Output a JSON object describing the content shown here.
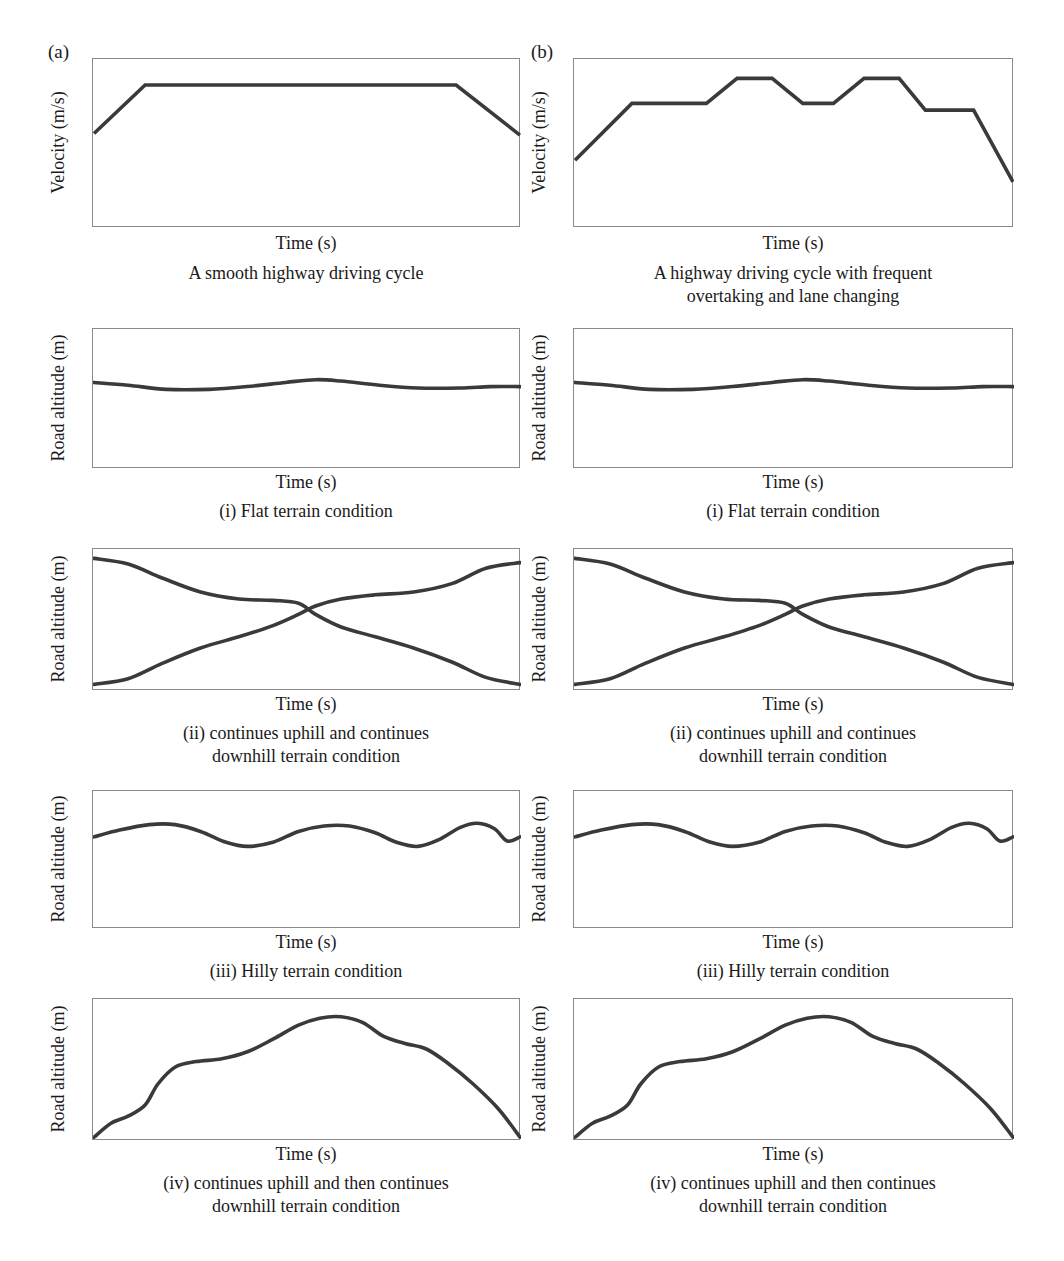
{
  "figure": {
    "columns": [
      {
        "letter": "(a)",
        "caption": "A smooth highway driving cycle"
      },
      {
        "letter": "(b)",
        "caption": "A highway driving cycle with frequent\novertaking and lane changing"
      }
    ],
    "axis_labels": {
      "velocity_y": "Velocity (m/s)",
      "altitude_y": "Road altitude (m)",
      "time_x": "Time (s)"
    },
    "terrain_captions": [
      "(i) Flat terrain condition",
      "(ii) continues uphill and continues\ndownhill terrain condition",
      "(iii) Hilly terrain condition",
      "(iv) continues uphill and then continues\ndownhill terrain condition"
    ],
    "colors": {
      "curve": "#3a3a3a",
      "axis": "#8a8a8a",
      "text": "#1a1a1a",
      "background": "#ffffff"
    }
  },
  "chart_data": [
    {
      "id": "a-velocity",
      "type": "line",
      "title": "A smooth highway driving cycle",
      "xlabel": "Time (s)",
      "ylabel": "Velocity (m/s)",
      "xlim": [
        0,
        100
      ],
      "ylim": [
        0,
        100
      ],
      "grid": false,
      "legend": "none",
      "points": [
        [
          0,
          56
        ],
        [
          12,
          85
        ],
        [
          85,
          85
        ],
        [
          100,
          55
        ]
      ]
    },
    {
      "id": "b-velocity",
      "type": "line",
      "title": "A highway driving cycle with frequent overtaking and lane changing",
      "xlabel": "Time (s)",
      "ylabel": "Velocity (m/s)",
      "xlim": [
        0,
        100
      ],
      "ylim": [
        0,
        100
      ],
      "grid": false,
      "legend": "none",
      "points": [
        [
          0,
          40
        ],
        [
          13,
          74
        ],
        [
          30,
          74
        ],
        [
          37,
          89
        ],
        [
          45,
          89
        ],
        [
          52,
          74
        ],
        [
          59,
          74
        ],
        [
          66,
          89
        ],
        [
          74,
          89
        ],
        [
          80,
          70
        ],
        [
          91,
          70
        ],
        [
          100,
          27
        ]
      ]
    },
    {
      "id": "a-flat",
      "type": "line",
      "title": "(i) Flat terrain condition",
      "xlabel": "Time (s)",
      "ylabel": "Road altitude (m)",
      "xlim": [
        0,
        100
      ],
      "ylim": [
        0,
        100
      ],
      "grid": false,
      "legend": "none",
      "points": [
        [
          0,
          62
        ],
        [
          8,
          60
        ],
        [
          17,
          57
        ],
        [
          27,
          57
        ],
        [
          36,
          59
        ],
        [
          45,
          62
        ],
        [
          52,
          64
        ],
        [
          58,
          63
        ],
        [
          67,
          60
        ],
        [
          76,
          58
        ],
        [
          86,
          58
        ],
        [
          93,
          59
        ],
        [
          100,
          59
        ]
      ]
    },
    {
      "id": "b-flat",
      "type": "line",
      "title": "(i) Flat terrain condition",
      "xlabel": "Time (s)",
      "ylabel": "Road altitude (m)",
      "xlim": [
        0,
        100
      ],
      "ylim": [
        0,
        100
      ],
      "grid": false,
      "legend": "none",
      "points": [
        [
          0,
          62
        ],
        [
          8,
          60
        ],
        [
          17,
          57
        ],
        [
          27,
          57
        ],
        [
          36,
          59
        ],
        [
          45,
          62
        ],
        [
          52,
          64
        ],
        [
          58,
          63
        ],
        [
          67,
          60
        ],
        [
          76,
          58
        ],
        [
          86,
          58
        ],
        [
          93,
          59
        ],
        [
          100,
          59
        ]
      ]
    },
    {
      "id": "a-uphill-downhill",
      "type": "line",
      "title": "(ii) continues uphill and continues downhill terrain condition",
      "xlabel": "Time (s)",
      "ylabel": "Road altitude (m)",
      "xlim": [
        0,
        100
      ],
      "ylim": [
        0,
        100
      ],
      "grid": false,
      "legend": "none",
      "series": [
        {
          "name": "downhill",
          "points": [
            [
              0,
              94
            ],
            [
              8,
              90
            ],
            [
              16,
              80
            ],
            [
              25,
              70
            ],
            [
              34,
              65
            ],
            [
              42,
              64
            ],
            [
              48,
              62
            ],
            [
              52,
              54
            ],
            [
              58,
              45
            ],
            [
              66,
              38
            ],
            [
              75,
              30
            ],
            [
              84,
              20
            ],
            [
              92,
              9
            ],
            [
              100,
              4
            ]
          ]
        },
        {
          "name": "uphill",
          "points": [
            [
              0,
              4
            ],
            [
              8,
              8
            ],
            [
              16,
              19
            ],
            [
              25,
              30
            ],
            [
              34,
              38
            ],
            [
              42,
              46
            ],
            [
              48,
              54
            ],
            [
              52,
              60
            ],
            [
              58,
              65
            ],
            [
              66,
              68
            ],
            [
              75,
              70
            ],
            [
              84,
              76
            ],
            [
              92,
              87
            ],
            [
              100,
              91
            ]
          ]
        }
      ]
    },
    {
      "id": "b-uphill-downhill",
      "type": "line",
      "title": "(ii) continues uphill and continues downhill terrain condition",
      "xlabel": "Time (s)",
      "ylabel": "Road altitude (m)",
      "xlim": [
        0,
        100
      ],
      "ylim": [
        0,
        100
      ],
      "grid": false,
      "legend": "none",
      "series": [
        {
          "name": "downhill",
          "points": [
            [
              0,
              94
            ],
            [
              8,
              90
            ],
            [
              16,
              80
            ],
            [
              25,
              70
            ],
            [
              34,
              65
            ],
            [
              42,
              64
            ],
            [
              48,
              62
            ],
            [
              52,
              54
            ],
            [
              58,
              45
            ],
            [
              66,
              38
            ],
            [
              75,
              30
            ],
            [
              84,
              20
            ],
            [
              92,
              9
            ],
            [
              100,
              4
            ]
          ]
        },
        {
          "name": "uphill",
          "points": [
            [
              0,
              4
            ],
            [
              8,
              8
            ],
            [
              16,
              19
            ],
            [
              25,
              30
            ],
            [
              34,
              38
            ],
            [
              42,
              46
            ],
            [
              48,
              54
            ],
            [
              52,
              60
            ],
            [
              58,
              65
            ],
            [
              66,
              68
            ],
            [
              75,
              70
            ],
            [
              84,
              76
            ],
            [
              92,
              87
            ],
            [
              100,
              91
            ]
          ]
        }
      ]
    },
    {
      "id": "a-hilly",
      "type": "line",
      "title": "(iii) Hilly terrain condition",
      "xlabel": "Time (s)",
      "ylabel": "Road altitude (m)",
      "xlim": [
        0,
        100
      ],
      "ylim": [
        0,
        100
      ],
      "grid": false,
      "legend": "none",
      "points": [
        [
          0,
          67
        ],
        [
          6,
          72
        ],
        [
          13,
          76
        ],
        [
          19,
          76
        ],
        [
          25,
          71
        ],
        [
          31,
          63
        ],
        [
          36,
          60
        ],
        [
          42,
          63
        ],
        [
          48,
          71
        ],
        [
          54,
          75
        ],
        [
          60,
          75
        ],
        [
          66,
          70
        ],
        [
          71,
          63
        ],
        [
          76,
          60
        ],
        [
          81,
          65
        ],
        [
          86,
          74
        ],
        [
          90,
          77
        ],
        [
          94,
          73
        ],
        [
          97,
          64
        ],
        [
          100,
          67
        ]
      ]
    },
    {
      "id": "b-hilly",
      "type": "line",
      "title": "(iii) Hilly terrain condition",
      "xlabel": "Time (s)",
      "ylabel": "Road altitude (m)",
      "xlim": [
        0,
        100
      ],
      "ylim": [
        0,
        100
      ],
      "grid": false,
      "legend": "none",
      "points": [
        [
          0,
          67
        ],
        [
          6,
          72
        ],
        [
          13,
          76
        ],
        [
          19,
          76
        ],
        [
          25,
          71
        ],
        [
          31,
          63
        ],
        [
          36,
          60
        ],
        [
          42,
          63
        ],
        [
          48,
          71
        ],
        [
          54,
          75
        ],
        [
          60,
          75
        ],
        [
          66,
          70
        ],
        [
          71,
          63
        ],
        [
          76,
          60
        ],
        [
          81,
          65
        ],
        [
          86,
          74
        ],
        [
          90,
          77
        ],
        [
          94,
          73
        ],
        [
          97,
          64
        ],
        [
          100,
          67
        ]
      ]
    },
    {
      "id": "a-mountain",
      "type": "line",
      "title": "(iv) continues uphill and then continues downhill terrain condition",
      "xlabel": "Time (s)",
      "ylabel": "Road altitude (m)",
      "xlim": [
        0,
        100
      ],
      "ylim": [
        0,
        100
      ],
      "grid": false,
      "legend": "none",
      "points": [
        [
          0,
          2
        ],
        [
          4,
          12
        ],
        [
          8,
          17
        ],
        [
          12,
          25
        ],
        [
          15,
          40
        ],
        [
          19,
          52
        ],
        [
          24,
          56
        ],
        [
          30,
          58
        ],
        [
          36,
          63
        ],
        [
          42,
          72
        ],
        [
          48,
          82
        ],
        [
          53,
          87
        ],
        [
          58,
          88
        ],
        [
          63,
          84
        ],
        [
          68,
          74
        ],
        [
          73,
          69
        ],
        [
          78,
          65
        ],
        [
          83,
          55
        ],
        [
          89,
          40
        ],
        [
          95,
          22
        ],
        [
          100,
          2
        ]
      ]
    },
    {
      "id": "b-mountain",
      "type": "line",
      "title": "(iv) continues uphill and then continues downhill terrain condition",
      "xlabel": "Time (s)",
      "ylabel": "Road altitude (m)",
      "xlim": [
        0,
        100
      ],
      "ylim": [
        0,
        100
      ],
      "grid": false,
      "legend": "none",
      "points": [
        [
          0,
          2
        ],
        [
          4,
          12
        ],
        [
          8,
          17
        ],
        [
          12,
          25
        ],
        [
          15,
          40
        ],
        [
          19,
          52
        ],
        [
          24,
          56
        ],
        [
          30,
          58
        ],
        [
          36,
          63
        ],
        [
          42,
          72
        ],
        [
          48,
          82
        ],
        [
          53,
          87
        ],
        [
          58,
          88
        ],
        [
          63,
          84
        ],
        [
          68,
          74
        ],
        [
          73,
          69
        ],
        [
          78,
          65
        ],
        [
          83,
          55
        ],
        [
          89,
          40
        ],
        [
          95,
          22
        ],
        [
          100,
          2
        ]
      ]
    }
  ],
  "layout": {
    "columns": [
      {
        "key": "a",
        "box_left": 92,
        "box_width": 428,
        "letter_left": 48,
        "letter_top": 42
      },
      {
        "key": "b",
        "box_left": 573,
        "box_width": 440,
        "letter_left": 531,
        "letter_top": 42
      }
    ],
    "rows": [
      {
        "key": "velocity",
        "box_top": 58,
        "box_height": 169,
        "xlabel_top": 233,
        "caption_top": 262,
        "ylabel_kind": "velocity",
        "smooth": false
      },
      {
        "key": "flat",
        "box_top": 328,
        "box_height": 140,
        "xlabel_top": 472,
        "caption_top": 500,
        "ylabel_kind": "altitude",
        "smooth": true
      },
      {
        "key": "cross",
        "box_top": 548,
        "box_height": 142,
        "xlabel_top": 694,
        "caption_top": 722,
        "ylabel_kind": "altitude",
        "smooth": true
      },
      {
        "key": "hilly",
        "box_top": 790,
        "box_height": 138,
        "xlabel_top": 932,
        "caption_top": 960,
        "ylabel_kind": "altitude",
        "smooth": true
      },
      {
        "key": "mountain",
        "box_top": 998,
        "box_height": 142,
        "xlabel_top": 1144,
        "caption_top": 1172,
        "ylabel_kind": "altitude",
        "smooth": true
      }
    ]
  }
}
